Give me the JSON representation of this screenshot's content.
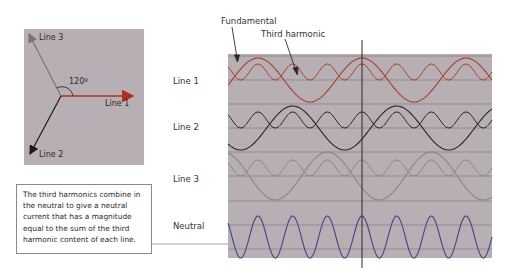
{
  "phasor_diagram": {
    "labels": {
      "line1": "Line 1",
      "line2": "Line 2",
      "line3": "Line 3"
    },
    "angle_label": "120º",
    "colors": {
      "background": "#b7afb4",
      "line1": "#b0301e",
      "line2": "#1a1a1a",
      "line3": "#7a7378"
    }
  },
  "waveform_chart": {
    "annotations": {
      "fundamental": "Fundamental",
      "third_harmonic": "Third harmonic"
    },
    "rows": [
      {
        "label": "Line 1",
        "color": "#a8402a"
      },
      {
        "label": "Line 2",
        "color": "#2a2226"
      },
      {
        "label": "Line 3",
        "color": "#8a8488"
      },
      {
        "label": "Neutral",
        "color": "#4a3f8a"
      }
    ],
    "colors": {
      "panel_background": "#b7afb4",
      "gridline": "#8d8489",
      "cursor_line": "#2b2b2b"
    }
  },
  "note": {
    "text": "The third harmonics combine in the neutral to give a neutral current that has a magnitude equal to the sum of the third harmonic content of each line."
  },
  "chart_data": {
    "type": "line",
    "title": "",
    "xlabel": "",
    "ylabel": "",
    "series": [
      {
        "name": "Line 1 fundamental",
        "frequency_multiple": 1,
        "phase_deg": 0
      },
      {
        "name": "Line 1 third harmonic",
        "frequency_multiple": 3,
        "phase_deg": 0
      },
      {
        "name": "Line 2 fundamental",
        "frequency_multiple": 1,
        "phase_deg": -120
      },
      {
        "name": "Line 2 third harmonic",
        "frequency_multiple": 3,
        "phase_deg": 0
      },
      {
        "name": "Line 3 fundamental",
        "frequency_multiple": 1,
        "phase_deg": 120
      },
      {
        "name": "Line 3 third harmonic",
        "frequency_multiple": 3,
        "phase_deg": 0
      },
      {
        "name": "Neutral (sum of third harmonics)",
        "frequency_multiple": 3,
        "amplitude_relative": 3
      }
    ],
    "cycles_shown_fundamental": 2.6,
    "grid": true,
    "legend": [
      "Fundamental",
      "Third harmonic"
    ]
  }
}
